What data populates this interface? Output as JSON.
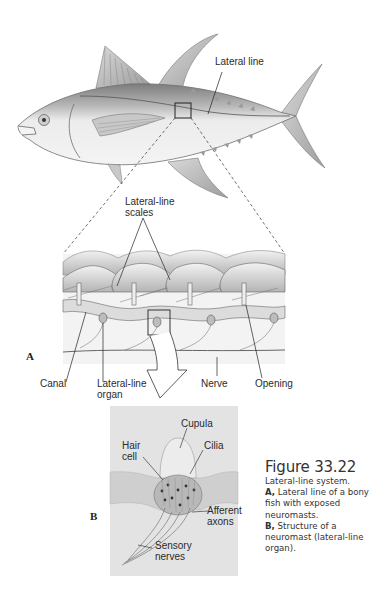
{
  "figure": {
    "number": "Figure 33.22",
    "caption_title": "Lateral-line system.",
    "caption_parts": [
      {
        "letter": "A,",
        "text": " Lateral line of a bony fish with exposed neuromasts."
      },
      {
        "letter": "B,",
        "text": " Structure of a neuromast (lateral-line organ)."
      }
    ]
  },
  "panel_a": {
    "letter": "A",
    "labels": {
      "lateral_line": "Lateral line",
      "scales_line1": "Lateral-line",
      "scales_line2": "scales",
      "canal": "Canal",
      "organ_line1": "Lateral-line",
      "organ_line2": "organ",
      "nerve": "Nerve",
      "opening": "Opening"
    }
  },
  "panel_b": {
    "letter": "B",
    "labels": {
      "cupula": "Cupula",
      "hair_line1": "Hair",
      "hair_line2": "cell",
      "cilia": "Cilia",
      "afferent_line1": "Afferent",
      "afferent_line2": "axons",
      "sensory_line1": "Sensory",
      "sensory_line2": "nerves"
    }
  },
  "colors": {
    "fish_fill": "#e9e9e9",
    "fish_dark": "#9a9a9a",
    "panel_b_bg": "#dcdcdc",
    "ink": "#2b2b2b"
  }
}
